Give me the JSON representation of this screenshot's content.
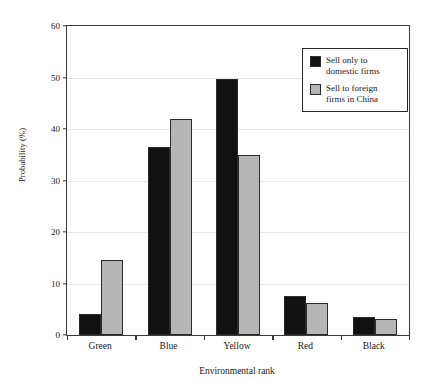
{
  "chart_data": {
    "type": "bar",
    "title": "",
    "xlabel": "Environmental rank",
    "ylabel": "Probability (%)",
    "categories": [
      "Green",
      "Blue",
      "Yellow",
      "Red",
      "Black"
    ],
    "series": [
      {
        "name": "Sell only to domestic firms",
        "color": "#111111",
        "values": [
          4.0,
          36.5,
          49.7,
          7.5,
          3.5
        ]
      },
      {
        "name": "Sell to foreign firms in China",
        "color": "#b6b6b6",
        "values": [
          14.5,
          42.0,
          35.0,
          6.2,
          3.2
        ]
      }
    ],
    "ylim": [
      0,
      60
    ],
    "yticks": [
      0,
      10,
      20,
      30,
      40,
      50,
      60
    ],
    "ytick_labels": [
      "0",
      "10",
      "20",
      "30",
      "40",
      "50",
      "60"
    ],
    "grid": true,
    "legend_position": "top-right"
  },
  "legend": {
    "entries": [
      {
        "label_line1": "Sell only to",
        "label_line2": "domestic firms",
        "swatch": "dark"
      },
      {
        "label_line1": "Sell to foreign",
        "label_line2": "firms in China",
        "swatch": "light"
      }
    ]
  }
}
